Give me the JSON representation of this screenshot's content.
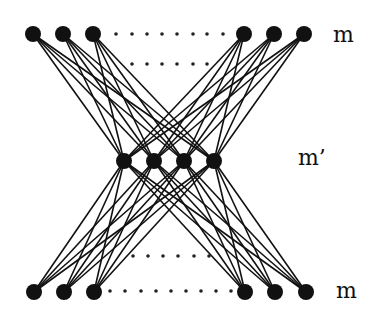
{
  "diagram": {
    "type": "layered-network",
    "colors": {
      "node": "#111111",
      "edge": "#111111",
      "dot": "#222222",
      "background": "#ffffff"
    },
    "node_radius": 8,
    "layers": [
      {
        "id": "top",
        "label": "m",
        "label_pos": [
          333,
          24
        ],
        "nodes": [
          [
            33,
            34
          ],
          [
            63,
            34
          ],
          [
            93,
            34
          ],
          [
            244,
            34
          ],
          [
            274,
            34
          ],
          [
            304,
            34
          ]
        ]
      },
      {
        "id": "middle",
        "label": "m’",
        "label_pos": [
          298,
          147
        ],
        "nodes": [
          [
            124,
            161
          ],
          [
            154,
            161
          ],
          [
            184,
            161
          ],
          [
            214,
            161
          ]
        ]
      },
      {
        "id": "bottom",
        "label": "m",
        "label_pos": [
          336,
          280
        ],
        "nodes": [
          [
            34,
            292
          ],
          [
            64,
            292
          ],
          [
            94,
            292
          ],
          [
            245,
            292
          ],
          [
            275,
            292
          ],
          [
            306,
            292
          ]
        ]
      }
    ],
    "edges": "complete-bipartite between adjacent layers",
    "ellipsis_rows": [
      {
        "y": 34,
        "xs": [
          116,
          132,
          147,
          162,
          177,
          193,
          207,
          223
        ]
      },
      {
        "y": 64,
        "xs": [
          132,
          147,
          162,
          177,
          193,
          207
        ]
      },
      {
        "y": 256,
        "xs": [
          133,
          148,
          163,
          178,
          194,
          209
        ]
      },
      {
        "y": 291,
        "xs": [
          110,
          125,
          141,
          156,
          171,
          186,
          201,
          216,
          231
        ]
      }
    ]
  }
}
